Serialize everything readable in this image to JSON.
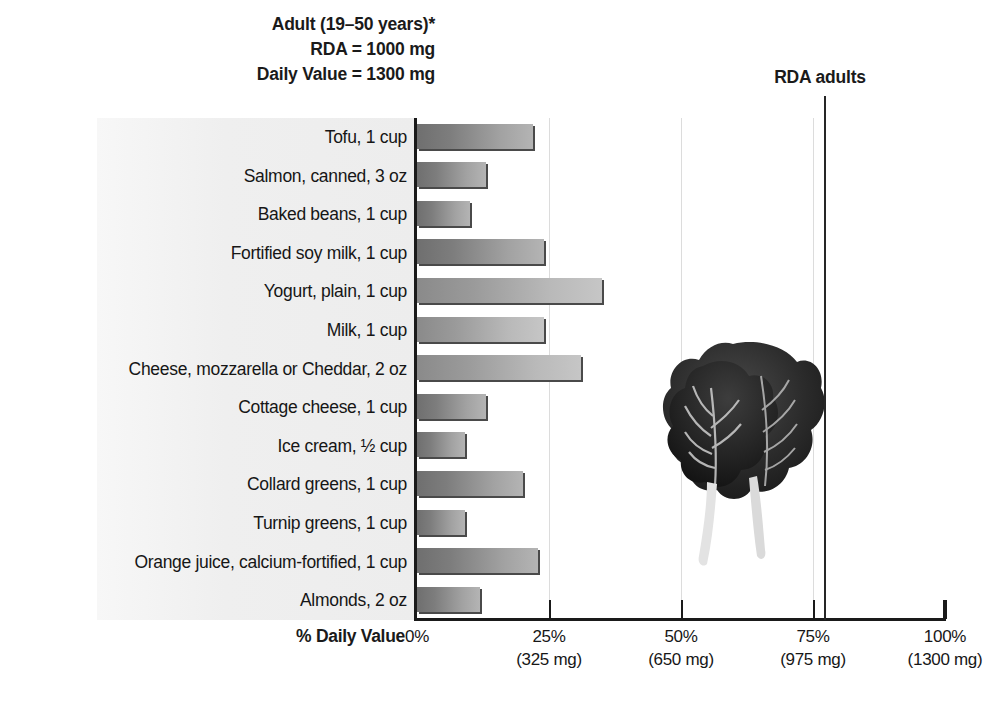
{
  "header": {
    "line1": "Adult (19–50 years)*",
    "line2": "RDA = 1000 mg",
    "line3": "Daily Value = 1300 mg",
    "rda_marker_label": "RDA adults"
  },
  "axis": {
    "title": "% Daily Value",
    "ticks": [
      {
        "pct": "0%",
        "mg": ""
      },
      {
        "pct": "25%",
        "mg": "(325 mg)"
      },
      {
        "pct": "50%",
        "mg": "(650 mg)"
      },
      {
        "pct": "75%",
        "mg": "(975 mg)"
      },
      {
        "pct": "100%",
        "mg": "(1300 mg)"
      }
    ]
  },
  "image_caption": {
    "alt": "collard-greens-leaves"
  },
  "colors": {
    "bar_dark": "#6f6f6f",
    "bar_light": "#b4b4b4",
    "bar_shadow": "#4a4a4a",
    "rda_line": "#262626",
    "gridline": "#dcdcdc",
    "axis": "#1a1a1a",
    "panel": "#efefef",
    "text": "#1a1a1a"
  },
  "chart_data": {
    "type": "bar",
    "orientation": "horizontal",
    "xlabel": "% Daily Value",
    "ylabel": "",
    "xlim": [
      0,
      100
    ],
    "xticks": [
      0,
      25,
      50,
      75,
      100
    ],
    "xticklabels": [
      "0%",
      "25%",
      "50%",
      "75%",
      "100%"
    ],
    "xtick_sublabels": [
      "",
      "(325 mg)",
      "(650 mg)",
      "(975 mg)",
      "(1300 mg)"
    ],
    "grid": "vertical-only",
    "legend": "none",
    "annotations": [
      {
        "text": "RDA adults",
        "x": 77,
        "type": "vertical-line"
      },
      {
        "text": "Adult (19–50 years)*"
      },
      {
        "text": "RDA = 1000 mg"
      },
      {
        "text": "Daily Value = 1300 mg"
      }
    ],
    "reference_lines": [
      {
        "label": "RDA adults",
        "value": 77
      }
    ],
    "categories": [
      "Tofu, 1 cup",
      "Salmon, canned, 3 oz",
      "Baked beans, 1 cup",
      "Fortified soy milk, 1 cup",
      "Yogurt, plain, 1 cup",
      "Milk, 1 cup",
      "Cheese, mozzarella or Cheddar, 2 oz",
      "Cottage cheese, 1 cup",
      "Ice cream, ½ cup",
      "Collard greens, 1 cup",
      "Turnip greens, 1 cup",
      "Orange juice, calcium-fortified, 1 cup",
      "Almonds, 2 oz"
    ],
    "values": [
      22,
      13,
      10,
      24,
      35,
      24,
      31,
      13,
      9,
      20,
      9,
      23,
      12
    ],
    "value_unit": "% Daily Value",
    "shade": [
      "dark",
      "dark",
      "dark",
      "dark",
      "light",
      "light",
      "light",
      "dark",
      "dark",
      "dark",
      "dark",
      "dark",
      "dark"
    ]
  }
}
